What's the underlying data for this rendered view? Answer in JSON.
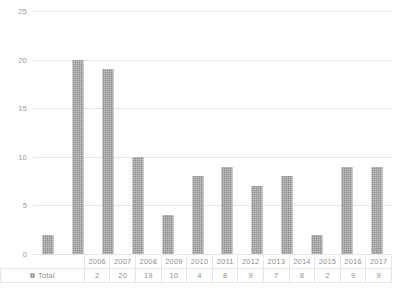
{
  "chart_data": {
    "type": "bar",
    "title": "",
    "subtitle": "",
    "xlabel": "",
    "ylabel": "",
    "categories": [
      "2006",
      "2007",
      "2008",
      "2009",
      "2010",
      "2011",
      "2012",
      "2013",
      "2014",
      "2015",
      "2016",
      "2017"
    ],
    "series": [
      {
        "name": "Total",
        "values": [
          2,
          20,
          19,
          10,
          4,
          8,
          9,
          7,
          8,
          2,
          9,
          9
        ]
      }
    ],
    "ylim": [
      0,
      25
    ],
    "ytick_labels": [
      "0",
      "5",
      "10",
      "15",
      "20",
      "25"
    ],
    "ytick_values": [
      0,
      5,
      10,
      15,
      20,
      25
    ],
    "grid": true,
    "grid_axis": "y",
    "legend_position": "data-table",
    "bar_color": "#8d8d8d",
    "grid_color": "#e8e8e8",
    "text_color": "#8f8f8f"
  },
  "data_table": {
    "legend_marker_name": "series-color-swatch",
    "row_label": "Total",
    "header_row": [
      "2006",
      "2007",
      "2008",
      "2009",
      "2010",
      "2011",
      "2012",
      "2013",
      "2014",
      "2015",
      "2016",
      "2017"
    ],
    "value_row": [
      "2",
      "20",
      "19",
      "10",
      "4",
      "8",
      "9",
      "7",
      "8",
      "2",
      "9",
      "9"
    ]
  }
}
